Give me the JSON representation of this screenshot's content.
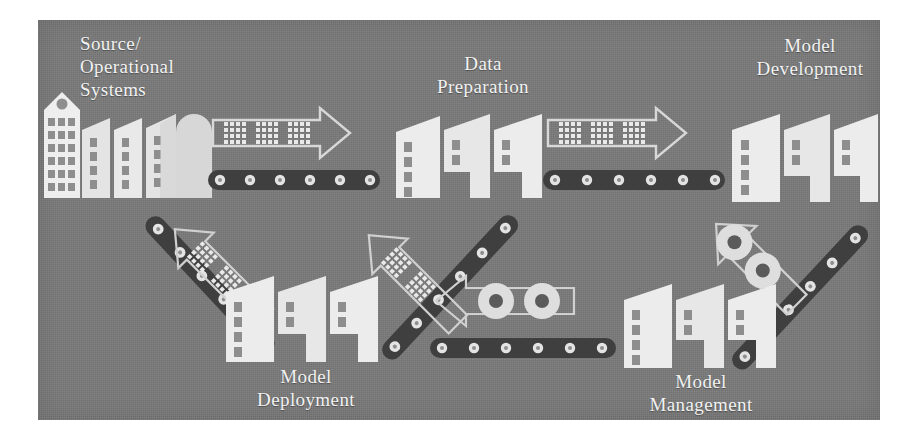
{
  "figure": {
    "type": "process-flow-diagram",
    "panel_color": "#7a7a7a",
    "label_color": "#f2f2f2",
    "shape_color": "#e9e9e9",
    "belt_color": "#4a4a4a"
  },
  "labels": {
    "source_operational_systems": "Source/\nOperational\nSystems",
    "data_preparation": "Data\nPreparation",
    "model_development": "Model\nDevelopment",
    "model_deployment": "Model\nDeployment",
    "model_management": "Model\nManagement"
  },
  "stages": [
    {
      "id": "source-operational-systems",
      "label": "Source/\nOperational\nSystems",
      "icon": "office-buildings-icon",
      "position": "top-left"
    },
    {
      "id": "data-preparation",
      "label": "Data\nPreparation",
      "icon": "factory-buildings-icon",
      "position": "top-center"
    },
    {
      "id": "model-development",
      "label": "Model\nDevelopment",
      "icon": "factory-buildings-icon",
      "position": "top-right"
    },
    {
      "id": "model-deployment",
      "label": "Model\nDeployment",
      "icon": "factory-buildings-icon",
      "position": "bottom-left"
    },
    {
      "id": "model-management",
      "label": "Model\nManagement",
      "icon": "factory-buildings-icon",
      "position": "bottom-center"
    }
  ],
  "connectors": [
    {
      "id": "source-to-data-preparation",
      "direction": "right",
      "cargo": "data-grid",
      "cargo_count": 3,
      "belt": "horizontal"
    },
    {
      "id": "data-preparation-to-development",
      "direction": "right",
      "cargo": "data-grid",
      "cargo_count": 3,
      "belt": "horizontal"
    },
    {
      "id": "development-to-management",
      "direction": "down-left",
      "cargo": "gear",
      "cargo_count": 2,
      "belt": "diagonal"
    },
    {
      "id": "management-to-deployment",
      "direction": "left",
      "cargo": "gear",
      "cargo_count": 2,
      "belt": "horizontal"
    },
    {
      "id": "deployment-feedback-upward",
      "direction": "up-left",
      "cargo": "data-grid",
      "cargo_count": 2,
      "belt": "diagonal"
    },
    {
      "id": "data-preparation-feedback",
      "direction": "up-left",
      "cargo": "data-grid",
      "cargo_count": 2,
      "belt": "diagonal"
    }
  ]
}
